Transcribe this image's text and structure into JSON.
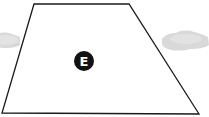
{
  "diagram": {
    "background": "#ffffff",
    "zone": {
      "shape": "trapezoid",
      "points": [
        [
          34,
          4
        ],
        [
          129,
          4
        ],
        [
          199,
          114
        ],
        [
          2,
          113
        ]
      ],
      "stroke": "#1a1a1a",
      "fill": "#ffffff"
    },
    "marker": {
      "label": "E",
      "cx": 84,
      "cy": 61,
      "r": 10,
      "fill": "#111111",
      "text_color": "#ffffff"
    },
    "vehicles": [
      {
        "name": "left-car",
        "color": "#d9d9d9",
        "side": "left"
      },
      {
        "name": "right-car",
        "color": "#d9d9d9",
        "side": "right"
      }
    ]
  }
}
